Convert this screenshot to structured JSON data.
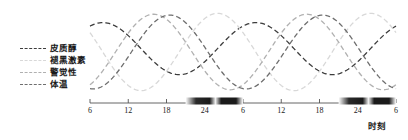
{
  "chart_data": {
    "type": "line",
    "title": "",
    "xlabel": "时刻",
    "ylabel": "",
    "grid": false,
    "legend_position": "left",
    "xlim": [
      6,
      54
    ],
    "ylim": [
      -1,
      1
    ],
    "x_ticks": [
      {
        "value": 6,
        "label": "6"
      },
      {
        "value": 12,
        "label": "12"
      },
      {
        "value": 18,
        "label": "18"
      },
      {
        "value": 24,
        "label": "24"
      },
      {
        "value": 30,
        "label": "6"
      },
      {
        "value": 36,
        "label": "12"
      },
      {
        "value": 42,
        "label": "18"
      },
      {
        "value": 48,
        "label": "24"
      },
      {
        "value": 54,
        "label": "6"
      }
    ],
    "night_bands": [
      {
        "start": 21,
        "end": 30,
        "label": "night-1"
      },
      {
        "start": 45,
        "end": 54,
        "label": "night-2"
      }
    ],
    "series": [
      {
        "name": "皮质醇",
        "color": "#3c3c3c",
        "dash": "5,3",
        "width": 1.3,
        "peak_hour": 8,
        "amplitude": 0.62,
        "offset": 0.08,
        "period": 24
      },
      {
        "name": "褪黑激素",
        "color": "#d8d8d8",
        "dash": "5,3",
        "width": 1.3,
        "peak_hour": 2,
        "amplitude": 0.92,
        "offset": 0.0,
        "period": 24
      },
      {
        "name": "警觉性",
        "color": "#b0b0b0",
        "dash": "5,3",
        "width": 1.3,
        "peak_hour": 16,
        "amplitude": 0.9,
        "offset": 0.0,
        "period": 24
      },
      {
        "name": "体温",
        "color": "#6e6e6e",
        "dash": "5,3",
        "width": 1.3,
        "peak_hour": 18.5,
        "amplitude": 0.88,
        "offset": 0.0,
        "period": 24
      }
    ],
    "axis_color": "#555555"
  },
  "legend": {
    "items": [
      {
        "label": "皮质醇",
        "color": "#3c3c3c"
      },
      {
        "label": "褪黑激素",
        "color": "#d8d8d8"
      },
      {
        "label": "警觉性",
        "color": "#b0b0b0"
      },
      {
        "label": "体温",
        "color": "#6e6e6e"
      }
    ]
  },
  "axis": {
    "title": "时刻"
  }
}
